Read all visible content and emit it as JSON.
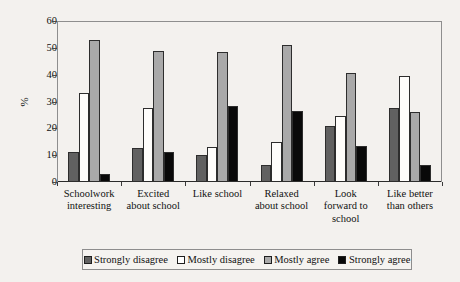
{
  "chart_data": {
    "type": "bar",
    "title": "",
    "xlabel": "",
    "ylabel": "%",
    "ylim": [
      0,
      60
    ],
    "yticks": [
      0,
      10,
      20,
      30,
      40,
      50,
      60
    ],
    "grid": false,
    "legend_position": "bottom",
    "categories": [
      "Schoolwork\ninteresting",
      "Excited\nabout school",
      "Like school",
      "Relaxed\nabout school",
      "Look\nforward to\nschool",
      "Like better\nthan others"
    ],
    "series": [
      {
        "name": "Strongly disagree",
        "color": "#616161",
        "values": [
          11,
          12.5,
          10,
          6.5,
          21,
          27.5
        ]
      },
      {
        "name": "Mostly disagree",
        "color": "#ffffff",
        "values": [
          33,
          27.5,
          13,
          15,
          24.5,
          39.5
        ]
      },
      {
        "name": "Mostly agree",
        "color": "#a9a9a9",
        "values": [
          53,
          49,
          48.5,
          51,
          40.5,
          26
        ]
      },
      {
        "name": "Strongly agree",
        "color": "#090909",
        "values": [
          3,
          11,
          28.5,
          26.5,
          13.5,
          6.5
        ]
      }
    ]
  },
  "legend": {
    "items": [
      {
        "label": "Strongly disagree"
      },
      {
        "label": "Mostly disagree"
      },
      {
        "label": "Mostly agree"
      },
      {
        "label": "Strongly agree"
      }
    ]
  }
}
